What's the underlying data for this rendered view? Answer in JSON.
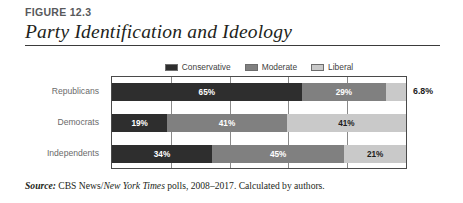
{
  "figure": {
    "number": "FIGURE 12.3",
    "title": "Party Identification and Ideology"
  },
  "source": {
    "prefix": "Source:",
    "text_before_italic": " CBS News/",
    "italic_part": "New York Times",
    "text_after_italic": " polls, 2008–2017. Calculated by authors."
  },
  "colors": {
    "conservative": "#2e2e2e",
    "moderate": "#808080",
    "liberal": "#c9c9c9",
    "frame": "#4a4a4a",
    "gridline": "#8a8a8a",
    "category_label": "#6a6a6a"
  },
  "chart_data": {
    "type": "bar",
    "orientation": "horizontal",
    "stacked": true,
    "title": "Party Identification and Ideology",
    "xlabel": "",
    "ylabel": "",
    "xlim": [
      0,
      100
    ],
    "grid": true,
    "gridline_values": [
      0,
      20,
      40,
      60,
      80,
      100
    ],
    "legend_position": "top-center",
    "categories": [
      "Republicans",
      "Democrats",
      "Independents"
    ],
    "series": [
      {
        "name": "Conservative",
        "color": "#2e2e2e",
        "values": [
          65,
          19,
          34
        ]
      },
      {
        "name": "Moderate",
        "color": "#808080",
        "values": [
          29,
          41,
          45
        ]
      },
      {
        "name": "Liberal",
        "color": "#c9c9c9",
        "values": [
          6.8,
          41,
          21
        ]
      }
    ],
    "bars": [
      {
        "category": "Republicans",
        "segments": [
          {
            "series": "Conservative",
            "value": 65,
            "label": "65%",
            "label_inside": true,
            "label_color": "light"
          },
          {
            "series": "Moderate",
            "value": 29,
            "label": "29%",
            "label_inside": true,
            "label_color": "light"
          },
          {
            "series": "Liberal",
            "value": 6.8,
            "label": "",
            "label_inside": false,
            "label_color": "dark"
          }
        ],
        "outside_label": "6.8%"
      },
      {
        "category": "Democrats",
        "segments": [
          {
            "series": "Conservative",
            "value": 19,
            "label": "19%",
            "label_inside": true,
            "label_color": "light"
          },
          {
            "series": "Moderate",
            "value": 41,
            "label": "41%",
            "label_inside": true,
            "label_color": "light"
          },
          {
            "series": "Liberal",
            "value": 41,
            "label": "41%",
            "label_inside": true,
            "label_color": "dark"
          }
        ],
        "outside_label": ""
      },
      {
        "category": "Independents",
        "segments": [
          {
            "series": "Conservative",
            "value": 34,
            "label": "34%",
            "label_inside": true,
            "label_color": "light"
          },
          {
            "series": "Moderate",
            "value": 45,
            "label": "45%",
            "label_inside": true,
            "label_color": "light"
          },
          {
            "series": "Liberal",
            "value": 21,
            "label": "21%",
            "label_inside": true,
            "label_color": "dark"
          }
        ],
        "outside_label": ""
      }
    ]
  }
}
